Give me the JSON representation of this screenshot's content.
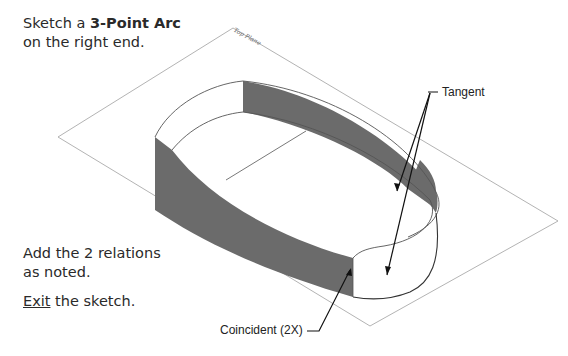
{
  "instructions": {
    "step1_prefix": "Sketch a ",
    "step1_bold": "3-Point Arc",
    "step1_suffix": "on the right end.",
    "step2_line1": "Add the 2 relations",
    "step2_line2": "as noted.",
    "step3_underlined": "Exit",
    "step3_suffix": " the sketch."
  },
  "drawing": {
    "plane_label": "Top Plane",
    "callouts": {
      "tangent": "Tangent",
      "coincident": "Coincident (2X)"
    },
    "colors": {
      "face_fill": "#6b6b6b",
      "plane_line": "#9a9a9a",
      "sketch_line": "#333333",
      "leader": "#111111"
    }
  }
}
